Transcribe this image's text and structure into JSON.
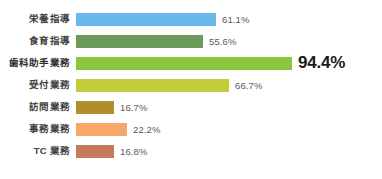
{
  "chart_data": {
    "type": "bar",
    "orientation": "horizontal",
    "title": "",
    "subtitle": "",
    "xlabel": "",
    "ylabel": "",
    "grid": false,
    "legend": "none",
    "xlim": [
      0,
      100
    ],
    "unit": "%",
    "categories": [
      "栄養指導",
      "食育指導",
      "歯科助手業務",
      "受付業務",
      "訪問業務",
      "事務業務",
      "TC 業務"
    ],
    "values": [
      61.1,
      55.6,
      94.4,
      66.7,
      16.7,
      22.2,
      16.8
    ],
    "value_labels": [
      "61.1%",
      "55.6%",
      "94.4%",
      "66.7%",
      "16.7%",
      "22.2%",
      "16.8%"
    ],
    "colors": [
      "#6BB8EA",
      "#6D9A5B",
      "#8CC63F",
      "#C3CC3A",
      "#B08E2E",
      "#F8A76A",
      "#C57A5C"
    ],
    "highlight_index": 2,
    "bars": [
      {
        "label": "栄養指導",
        "value": 61.1,
        "value_label": "61.1%",
        "color": "#6BB8EA",
        "highlight": false
      },
      {
        "label": "食育指導",
        "value": 55.6,
        "value_label": "55.6%",
        "color": "#6D9A5B",
        "highlight": false
      },
      {
        "label": "歯科助手業務",
        "value": 94.4,
        "value_label": "94.4%",
        "color": "#8CC63F",
        "highlight": true
      },
      {
        "label": "受付業務",
        "value": 66.7,
        "value_label": "66.7%",
        "color": "#C3CC3A",
        "highlight": false
      },
      {
        "label": "訪問業務",
        "value": 16.7,
        "value_label": "16.7%",
        "color": "#B08E2E",
        "highlight": false
      },
      {
        "label": "事務業務",
        "value": 22.2,
        "value_label": "22.2%",
        "color": "#F8A76A",
        "highlight": false
      },
      {
        "label": "TC 業務",
        "value": 16.8,
        "value_label": "16.8%",
        "color": "#C57A5C",
        "highlight": false
      }
    ]
  },
  "layout": {
    "bar_origin_x": 76,
    "bar_max_width": 229,
    "row_pitch": 22,
    "first_row_top": 11,
    "bar_height": 13,
    "label_gap": 6,
    "background": "#FFFFFF"
  }
}
